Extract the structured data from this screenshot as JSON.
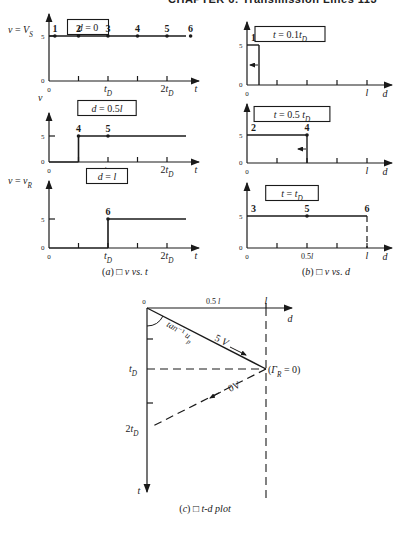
{
  "header": {
    "running_title": "CHAPTER 6: Transmission Lines 113"
  },
  "panel_a": {
    "caption": "(a) □ v vs. t",
    "xaxis": {
      "label": "t",
      "ticks": [
        "0",
        "t_D",
        "2t_D"
      ],
      "origin": "0"
    },
    "plots": [
      {
        "ylabel": "v = V_S",
        "condition": "d = 0",
        "y5": "5",
        "y0": "0",
        "points": [
          {
            "n": "1",
            "t": 0.1
          },
          {
            "n": "2",
            "t": 0.5
          },
          {
            "n": "3",
            "t": 1.0
          },
          {
            "n": "4",
            "t": 1.5
          },
          {
            "n": "5",
            "t": 2.0
          },
          {
            "n": "6",
            "t": 2.4
          }
        ],
        "step_at": 0.0
      },
      {
        "ylabel": "v",
        "condition": "d = 0.5l",
        "y5": "5",
        "y0": "0",
        "points": [
          {
            "n": "4",
            "t": 0.5
          },
          {
            "n": "5",
            "t": 1.0
          }
        ],
        "step_at": 0.5
      },
      {
        "ylabel": "v = v_R",
        "condition": "d = l",
        "y5": "5",
        "y0": "0",
        "points": [
          {
            "n": "6",
            "t": 1.0
          }
        ],
        "step_at": 1.0
      }
    ]
  },
  "panel_b": {
    "caption": "(b) □ v vs. d",
    "xaxis": {
      "label": "d",
      "ticks": [
        "0",
        "0.5l",
        "l"
      ]
    },
    "plots": [
      {
        "condition": "t = 0.1t_D",
        "y5": "5",
        "y0": "0",
        "front_at": 0.1,
        "labels": [
          {
            "n": "1",
            "d": 0.0
          }
        ],
        "arrow": "left"
      },
      {
        "condition": "t = 0.5 t_D",
        "y5": "5",
        "y0": "0",
        "front_at": 0.5,
        "labels": [
          {
            "n": "2",
            "d": 0.0
          },
          {
            "n": "4",
            "d": 0.5
          }
        ],
        "arrow": "left"
      },
      {
        "condition": "t = t_D",
        "y5": "5",
        "y0": "0",
        "front_at": 1.0,
        "labels": [
          {
            "n": "3",
            "d": 0.0
          },
          {
            "n": "5",
            "d": 0.5
          },
          {
            "n": "6",
            "d": 1.0
          }
        ],
        "arrow": "none"
      }
    ]
  },
  "panel_c": {
    "caption": "(c) □ t-d plot",
    "origin": "0",
    "d_axis": {
      "label": "d",
      "tick_half": "0.5 l",
      "tick_full": "l"
    },
    "t_axis": {
      "label": "t",
      "ticks": [
        "t_D",
        "2t_D"
      ]
    },
    "angle_label": "tan⁻¹ u_p",
    "incident_label": "5 V",
    "reflected_label": "0V",
    "load_label": "(Γ_R = 0)"
  },
  "chart_data": [
    {
      "type": "line",
      "title": "v vs. t at d = 0",
      "xlabel": "t",
      "ylabel": "v = V_S",
      "x": [
        0,
        2.5
      ],
      "values": [
        5,
        5
      ],
      "ylim": [
        0,
        6
      ]
    },
    {
      "type": "line",
      "title": "v vs. t at d = 0.5l",
      "xlabel": "t",
      "ylabel": "v",
      "x": [
        0,
        0.5,
        0.5,
        2.5
      ],
      "values": [
        0,
        0,
        5,
        5
      ],
      "ylim": [
        0,
        6
      ]
    },
    {
      "type": "line",
      "title": "v vs. t at d = l",
      "xlabel": "t",
      "ylabel": "v = v_R",
      "x": [
        0,
        1.0,
        1.0,
        2.5
      ],
      "values": [
        0,
        0,
        5,
        5
      ],
      "ylim": [
        0,
        6
      ]
    },
    {
      "type": "line",
      "title": "v vs. d at t = 0.1t_D",
      "xlabel": "d",
      "ylabel": "v",
      "x": [
        0,
        0.1,
        0.1,
        1.0
      ],
      "values": [
        5,
        5,
        0,
        0
      ],
      "ylim": [
        0,
        6
      ]
    },
    {
      "type": "line",
      "title": "v vs. d at t = 0.5t_D",
      "xlabel": "d",
      "ylabel": "v",
      "x": [
        0,
        0.5,
        0.5,
        1.0
      ],
      "values": [
        5,
        5,
        0,
        0
      ],
      "ylim": [
        0,
        6
      ]
    },
    {
      "type": "line",
      "title": "v vs. d at t = t_D",
      "xlabel": "d",
      "ylabel": "v",
      "x": [
        0,
        1.0
      ],
      "values": [
        5,
        5
      ],
      "ylim": [
        0,
        6
      ]
    }
  ]
}
